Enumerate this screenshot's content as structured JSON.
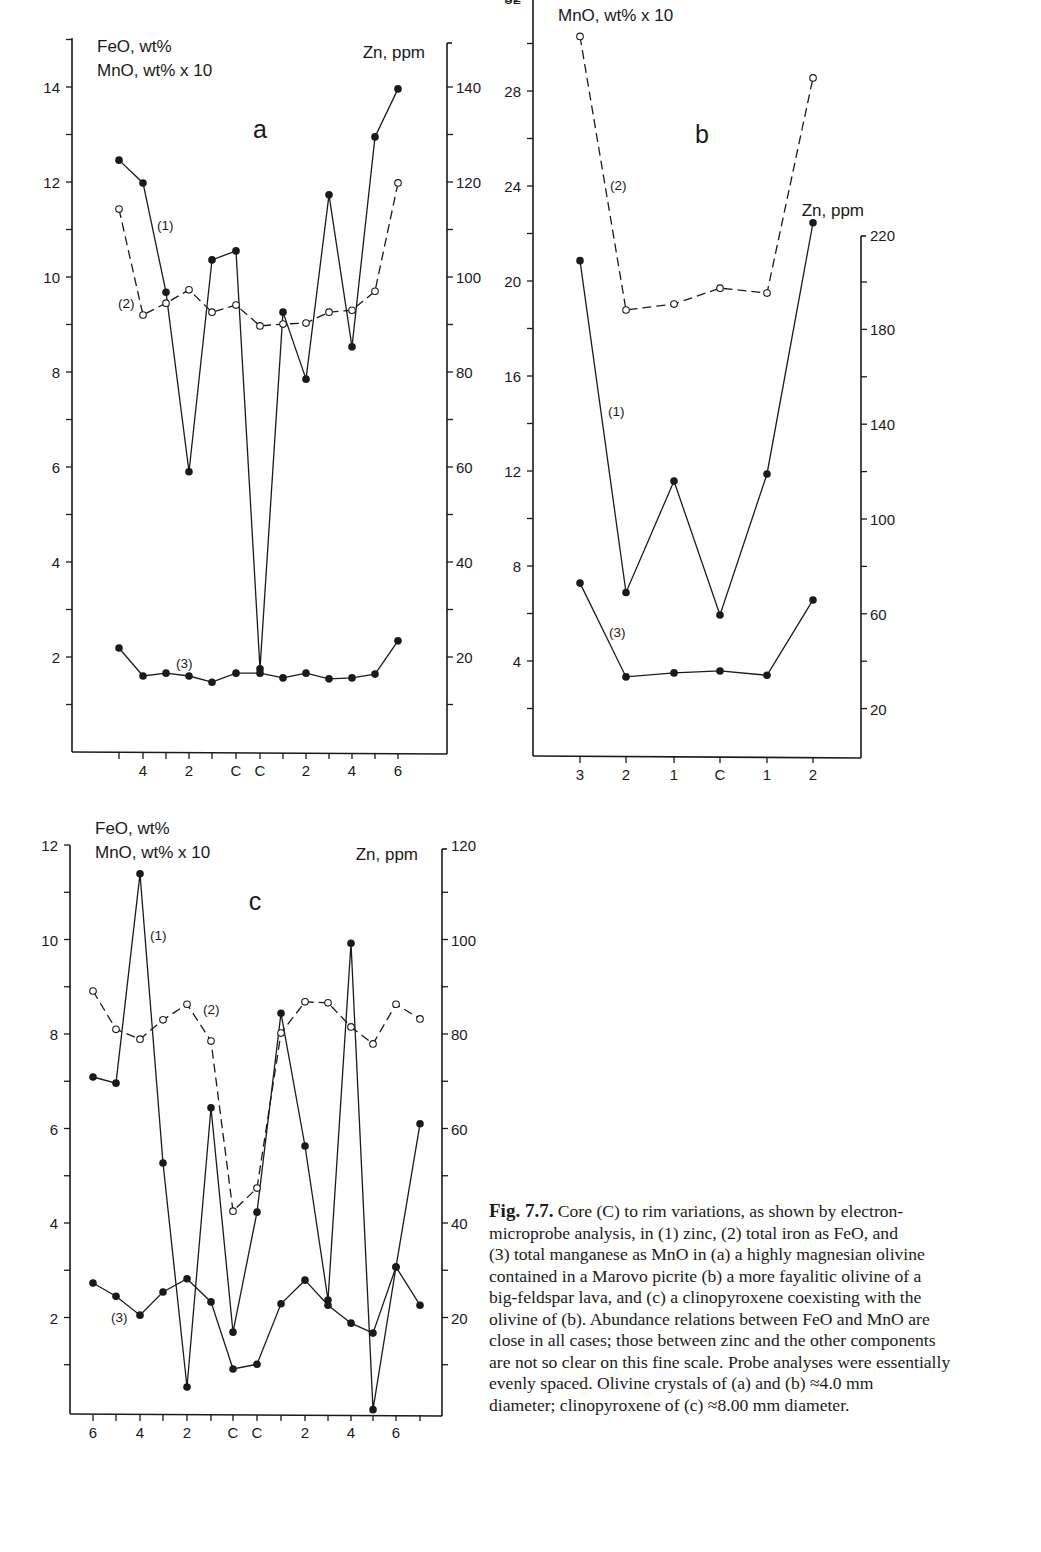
{
  "figure": {
    "caption": {
      "label": "Fig. 7.7.",
      "lines": [
        " Core (C) to rim variations, as shown by electron-",
        "microprobe analysis, in (1) zinc, (2) total iron as FeO, and",
        "(3) total manganese as MnO in (a) a highly magnesian olivine",
        "contained in a Marovo picrite (b) a more fayalitic olivine of a",
        "big-feldspar lava, and (c) a clinopyroxene coexisting with the",
        "olivine of (b). Abundance relations between FeO and MnO are",
        "close in all cases; those between zinc and the other components",
        "are not so clear on this fine scale. Probe analyses were essentially",
        "evenly spaced. Olivine crystals of (a) and (b) ≈4.0 mm",
        "diameter; clinopyroxene of (c) ≈8.00 mm diameter."
      ]
    },
    "colors": {
      "ink": "#1a1a1a",
      "background": "#ffffff"
    }
  },
  "chart_data": [
    {
      "id": "a",
      "type": "line",
      "title": "a",
      "left_axis_label": [
        "FeO, wt%",
        "MnO, wt% x 10"
      ],
      "right_axis_label": "Zn, ppm",
      "xlabel": "",
      "x_tick_labels": [
        "",
        "4",
        "",
        "2",
        "",
        "C",
        "C",
        "",
        "2",
        "",
        "4",
        "",
        "6"
      ],
      "left_ylim": [
        0,
        15
      ],
      "left_yticks": [
        2,
        4,
        6,
        8,
        10,
        12,
        14
      ],
      "right_ylim": [
        0,
        150
      ],
      "right_yticks": [
        20,
        40,
        60,
        80,
        100,
        120,
        140
      ],
      "grid": false,
      "series": [
        {
          "name": "(1) Zn",
          "axis": "right",
          "style": "solid",
          "marker": "filled",
          "values": [
            124.6,
            119.8,
            96.8,
            59.0,
            103.6,
            105.5,
            17.5,
            92.6,
            78.5,
            117.3,
            85.3,
            129.5,
            139.6
          ]
        },
        {
          "name": "(2) FeO",
          "axis": "left",
          "style": "dashed",
          "marker": "open",
          "values": [
            11.43,
            9.2,
            9.45,
            9.73,
            9.26,
            9.41,
            8.97,
            9.01,
            9.03,
            9.26,
            9.3,
            9.7,
            11.98
          ]
        },
        {
          "name": "(3) MnO x10",
          "axis": "left",
          "style": "solid",
          "marker": "filled",
          "values": [
            2.19,
            1.6,
            1.66,
            1.6,
            1.47,
            1.66,
            1.66,
            1.56,
            1.66,
            1.54,
            1.56,
            1.64,
            2.34
          ]
        }
      ],
      "annotations": [
        "(1)",
        "(2)",
        "(3)"
      ]
    },
    {
      "id": "b",
      "type": "line",
      "title": "b",
      "left_axis_label": [
        "MnO, wt% x 10"
      ],
      "right_axis_label": "Zn, ppm",
      "xlabel": "",
      "x_tick_labels": [
        "3",
        "2",
        "1",
        "C",
        "1",
        "2"
      ],
      "left_ylim": [
        0,
        32
      ],
      "left_yticks": [
        4,
        8,
        12,
        16,
        20,
        24,
        28,
        32
      ],
      "right_ylim": [
        0,
        220
      ],
      "right_yticks": [
        20,
        60,
        100,
        140,
        180,
        220
      ],
      "grid": false,
      "series": [
        {
          "name": "(1) Zn",
          "axis": "right",
          "style": "solid",
          "marker": "filled",
          "values": [
            209,
            69,
            116,
            59.5,
            119,
            225
          ]
        },
        {
          "name": "(2) FeO",
          "axis": "left",
          "style": "dashed",
          "marker": "open",
          "values": [
            30.3,
            18.78,
            19.03,
            19.7,
            19.49,
            28.55
          ]
        },
        {
          "name": "(3) MnO x10",
          "axis": "left",
          "style": "solid",
          "marker": "filled",
          "values": [
            7.28,
            3.33,
            3.5,
            3.58,
            3.4,
            6.57
          ]
        }
      ],
      "annotations": [
        "(1)",
        "(2)",
        "(3)"
      ]
    },
    {
      "id": "c",
      "type": "line",
      "title": "c",
      "left_axis_label": [
        "FeO, wt%",
        "MnO, wt% x 10"
      ],
      "right_axis_label": "Zn, ppm",
      "xlabel": "",
      "x_tick_labels": [
        "6",
        "",
        "4",
        "",
        "2",
        "",
        "C",
        "C",
        "",
        "2",
        "",
        "4",
        "",
        "6",
        ""
      ],
      "left_ylim": [
        0,
        12
      ],
      "left_yticks": [
        2,
        4,
        6,
        8,
        10,
        12
      ],
      "right_ylim": [
        0,
        120
      ],
      "right_yticks": [
        20,
        40,
        60,
        80,
        100,
        120
      ],
      "grid": false,
      "series": [
        {
          "name": "(1) Zn",
          "axis": "right",
          "style": "solid",
          "marker": "filled",
          "values": [
            70.9,
            69.6,
            113.9,
            52.7,
            5.3,
            64.4,
            16.9,
            42.3,
            84.4,
            56.3,
            23.7,
            99.2,
            0.5,
            30.7,
            61.0
          ]
        },
        {
          "name": "(2) FeO",
          "axis": "left",
          "style": "dashed",
          "marker": "open",
          "values": [
            8.91,
            8.1,
            7.89,
            8.3,
            8.63,
            7.85,
            4.25,
            4.74,
            8.02,
            8.68,
            8.66,
            8.15,
            7.79,
            8.63,
            8.32
          ]
        },
        {
          "name": "(3) MnO x10",
          "axis": "left",
          "style": "solid",
          "marker": "filled",
          "values": [
            2.73,
            2.45,
            2.05,
            2.54,
            2.82,
            2.33,
            0.91,
            1.01,
            2.29,
            2.79,
            2.26,
            1.88,
            1.67,
            3.07,
            2.26
          ]
        }
      ],
      "annotations": [
        "(1)",
        "(2)",
        "(3)"
      ]
    }
  ],
  "layout": {
    "a": {
      "xL": 72,
      "xR": 447,
      "yTop": 38,
      "yBot": 752,
      "y0": 752,
      "pxPerUnit": 47.5,
      "rightPxPerUnit": 4.75,
      "xs": [
        119,
        143,
        166,
        189,
        212,
        236,
        260,
        283,
        306,
        329,
        352,
        375,
        398
      ],
      "titlePos": [
        260,
        138
      ],
      "leftLabelPos": [
        97,
        52
      ],
      "rightLabelPos": [
        425,
        58
      ],
      "rightAxisTop": 43,
      "ann": [
        [
          157,
          230
        ],
        [
          118,
          308
        ],
        [
          176,
          668
        ]
      ]
    },
    "b": {
      "xL": 533,
      "xR": 861,
      "yTop": 0,
      "yBot": 756,
      "y0": 756,
      "pxPerUnit": 23.75,
      "rightPxPerUnit": 2.37,
      "xs": [
        580,
        626,
        674,
        720,
        767,
        813
      ],
      "titlePos": [
        702,
        143
      ],
      "leftLabelPos": [
        558,
        21
      ],
      "rightLabelPos": [
        864,
        216
      ],
      "rightAxisTop": 236,
      "ann": [
        [
          608,
          416
        ],
        [
          610,
          190
        ],
        [
          609,
          637
        ]
      ]
    },
    "c": {
      "xL": 70,
      "xR": 442,
      "yTop": 845,
      "yBot": 1414,
      "y0": 1412,
      "pxPerUnit": 47.25,
      "rightPxPerUnit": 4.725,
      "xs": [
        93,
        116,
        140,
        163,
        187,
        211,
        233,
        257,
        281,
        305,
        328,
        351,
        373,
        396,
        420
      ],
      "titlePos": [
        255,
        910
      ],
      "leftLabelPos": [
        95,
        834
      ],
      "rightLabelPos": [
        418,
        860
      ],
      "rightAxisTop": 849,
      "ann": [
        [
          150,
          940
        ],
        [
          203,
          1014
        ],
        [
          111,
          1322
        ]
      ]
    }
  }
}
